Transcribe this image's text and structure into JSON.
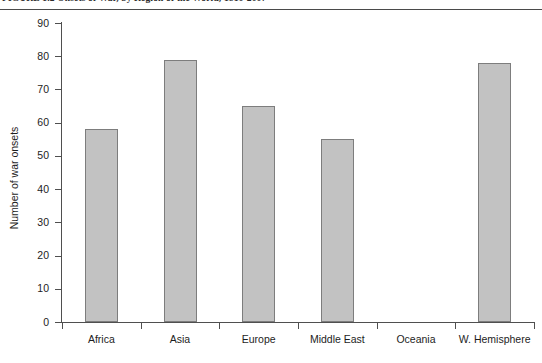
{
  "figure": {
    "caption": "FIGURE 1.2  Onsets of War, by Region of the World, 1816-2007",
    "caption_visible_note": "top of caption cropped by figure edge"
  },
  "chart_data": {
    "type": "bar",
    "title": "",
    "xlabel": "",
    "ylabel": "Number of war onsets",
    "categories": [
      "Africa",
      "Asia",
      "Europe",
      "Middle East",
      "Oceania",
      "W. Hemisphere"
    ],
    "values": [
      58,
      79,
      65,
      55,
      0,
      78
    ],
    "ylim": [
      0,
      90
    ],
    "ytick_labels": [
      "0",
      "10",
      "20",
      "30",
      "40",
      "50",
      "60",
      "70",
      "80",
      "90"
    ],
    "ytick_values": [
      0,
      10,
      20,
      30,
      40,
      50,
      60,
      70,
      80,
      90
    ],
    "grid": false,
    "legend": false,
    "bar_fill_color": "#c2c2c2",
    "bar_border_color": "#7d7d7d",
    "axis_color": "#4f4f4f"
  }
}
